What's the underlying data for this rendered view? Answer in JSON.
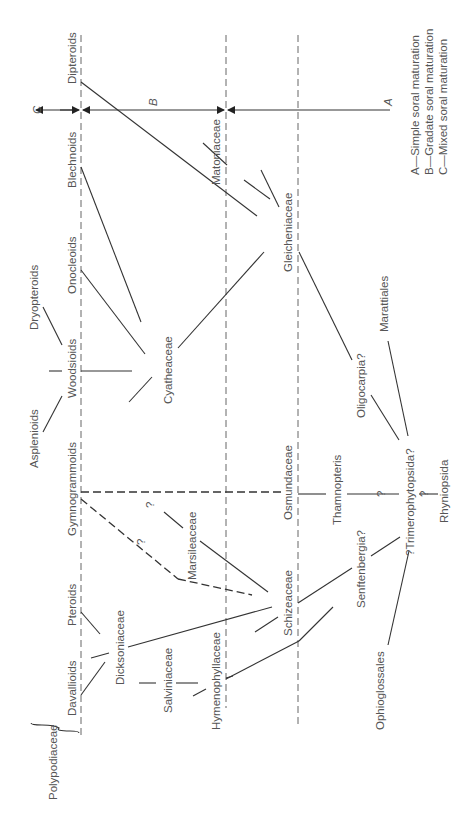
{
  "diagram": {
    "orientation": "rotated -90deg (text reads bottom-to-top)",
    "taxa": {
      "dipteroids": "Dipteroids",
      "blechnoids": "Blechnoids",
      "onocleoids": "Onocleoids",
      "dryopteroids": "Dryopteroids",
      "woodsioids": "Woodsioids",
      "asplenioids": "Asplenioids",
      "gymnogrammoids": "Gymnogrammoids",
      "pteroids": "Pteroids",
      "davallioids": "Davallioids",
      "polypodiaceae": "Polypodiaceae",
      "dicksoniaceae": "Dicksoniaceae",
      "salviniaceae": "Salviniaceae",
      "hymenophyllaceae": "Hymenophyllaceae",
      "cyatheaceae": "Cyatheaceae",
      "marsileaceae": "Marsileaceae",
      "schizeaceae": "Schizeaceae",
      "matoniaceae": "Matoniaceae",
      "gleicheniaceae": "Gleicheniaceae",
      "osmundaceae": "Osmundaceae",
      "thamnopteris": "Thamnopteris",
      "senftenbergia": "Senftenbergia?",
      "oligocarpia": "Oligocarpia?",
      "marattiales": "Marattiales",
      "trimerophytopsida": "?Trimerophytopsida?",
      "rhyniopsida": "Rhyniopsida",
      "ophioglossales": "Ophioglossales"
    },
    "question_marks": [
      "?",
      "?",
      "?",
      "?"
    ],
    "arrows": {
      "c": "C",
      "b": "B",
      "a": "A"
    },
    "legend": [
      "A—Simple soral maturation",
      "B—Gradate soral maturation",
      "C—Mixed soral maturation"
    ]
  }
}
